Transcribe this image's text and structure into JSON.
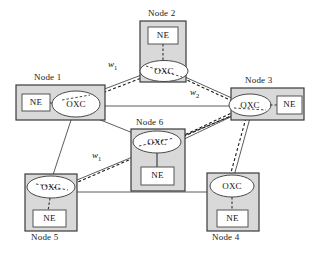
{
  "figure": {
    "type": "network-topology-diagram",
    "colors": {
      "node_fill": "#d9d9d9",
      "node_border": "#3a3a3a",
      "inner_fill": "#ffffff",
      "inner_border": "#555555",
      "oxc_fill": "#ffffff",
      "oxc_border": "#4a4a4a",
      "solid_link": "#4a4a4a",
      "dashed_link": "#1a1a1a",
      "text": "#1a1a1a",
      "background": "#ffffff"
    }
  },
  "nodes": [
    {
      "id": "node1",
      "label": "Node 1",
      "label_position": "top",
      "layout": "horizontal",
      "elements": [
        {
          "kind": "ne",
          "label": "NE"
        },
        {
          "kind": "oxc",
          "label": "OXC"
        }
      ]
    },
    {
      "id": "node2",
      "label": "Node 2",
      "label_position": "top",
      "layout": "vertical",
      "elements": [
        {
          "kind": "ne",
          "label": "NE"
        },
        {
          "kind": "oxc",
          "label": "OXC"
        }
      ]
    },
    {
      "id": "node3",
      "label": "Node 3",
      "label_position": "top",
      "layout": "horizontal-mirrored",
      "elements": [
        {
          "kind": "oxc",
          "label": "OXC"
        },
        {
          "kind": "ne",
          "label": "NE"
        }
      ]
    },
    {
      "id": "node4",
      "label": "Node 4",
      "label_position": "bottom",
      "layout": "vertical",
      "elements": [
        {
          "kind": "oxc",
          "label": "OXC"
        },
        {
          "kind": "ne",
          "label": "NE"
        }
      ]
    },
    {
      "id": "node5",
      "label": "Node 5",
      "label_position": "bottom",
      "layout": "vertical",
      "elements": [
        {
          "kind": "oxc",
          "label": "OXC"
        },
        {
          "kind": "ne",
          "label": "NE"
        }
      ]
    },
    {
      "id": "node6",
      "label": "Node 6",
      "label_position": "top",
      "layout": "vertical",
      "elements": [
        {
          "kind": "oxc",
          "label": "OXC"
        },
        {
          "kind": "ne",
          "label": "NE"
        }
      ]
    }
  ],
  "links": [
    {
      "from": "node1",
      "to": "node2",
      "style": "solid"
    },
    {
      "from": "node1",
      "to": "node2",
      "style": "dashed",
      "label": "w1"
    },
    {
      "from": "node2",
      "to": "node3",
      "style": "solid"
    },
    {
      "from": "node2",
      "to": "node3",
      "style": "dashed",
      "label": "w2"
    },
    {
      "from": "node1",
      "to": "node3",
      "style": "solid"
    },
    {
      "from": "node1",
      "to": "node6",
      "style": "solid"
    },
    {
      "from": "node6",
      "to": "node3",
      "style": "solid"
    },
    {
      "from": "node6",
      "to": "node3",
      "style": "dashed"
    },
    {
      "from": "node1",
      "to": "node5",
      "style": "solid"
    },
    {
      "from": "node5",
      "to": "node6",
      "style": "solid"
    },
    {
      "from": "node5",
      "to": "node3",
      "style": "dashed",
      "label": "w1"
    },
    {
      "from": "node5",
      "to": "node4",
      "style": "solid"
    },
    {
      "from": "node3",
      "to": "node4",
      "style": "solid"
    },
    {
      "from": "node3",
      "to": "node4",
      "style": "dashed"
    }
  ],
  "wavelength_labels": [
    {
      "id": "w1-top",
      "base": "w",
      "sub": "1"
    },
    {
      "id": "w2-mid",
      "base": "w",
      "sub": "2"
    },
    {
      "id": "w1-bottom",
      "base": "w",
      "sub": "1"
    }
  ],
  "text": {
    "node1": "Node 1",
    "node2": "Node 2",
    "node3": "Node 3",
    "node4": "Node 4",
    "node5": "Node 5",
    "node6": "Node 6",
    "ne": "NE",
    "oxc": "OXC",
    "w_base": "w",
    "w1_sub": "1",
    "w2_sub": "2"
  }
}
